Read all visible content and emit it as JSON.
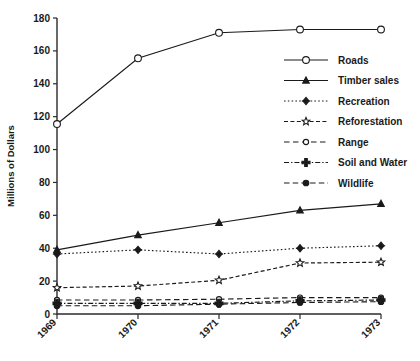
{
  "chart_data": {
    "type": "line",
    "title": "",
    "xlabel": "",
    "ylabel": "Millions of Dollars",
    "categories": [
      "1969",
      "1970",
      "1971",
      "1972",
      "1973"
    ],
    "x": [
      1969,
      1970,
      1971,
      1972,
      1973
    ],
    "xlim": [
      1969,
      1973
    ],
    "ylim": [
      0,
      180
    ],
    "yticks": [
      0,
      20,
      40,
      60,
      80,
      100,
      120,
      140,
      160,
      180
    ],
    "ytick_labels": [
      "0",
      "20",
      "40",
      "60",
      "80",
      "100",
      "120",
      "140",
      "160",
      "180"
    ],
    "grid": false,
    "legend_position": "right-upper",
    "series": [
      {
        "name": "Roads",
        "marker": "circle-open",
        "linestyle": "solid",
        "values": [
          115.5,
          155.5,
          171,
          173,
          173
        ]
      },
      {
        "name": "Timber sales",
        "marker": "triangle-solid",
        "linestyle": "solid",
        "values": [
          39,
          48,
          55.5,
          63,
          67
        ]
      },
      {
        "name": "Recreation",
        "marker": "diamond-solid",
        "linestyle": "dotted",
        "values": [
          36.5,
          39,
          36.5,
          40,
          41.5
        ]
      },
      {
        "name": "Reforestation",
        "marker": "star-open",
        "linestyle": "dashed",
        "values": [
          16,
          17,
          20.5,
          31,
          31.5
        ]
      },
      {
        "name": "Range",
        "marker": "circle-open-small",
        "linestyle": "dashed-long",
        "values": [
          8.5,
          8.5,
          9,
          10,
          10
        ]
      },
      {
        "name": "Soil and Water",
        "marker": "plus-solid",
        "linestyle": "dashdot",
        "values": [
          6.5,
          6.5,
          6.5,
          8,
          8.5
        ]
      },
      {
        "name": "Wildlife",
        "marker": "circle-solid",
        "linestyle": "dashed-long2",
        "values": [
          5,
          5,
          6,
          7,
          7.5
        ]
      }
    ]
  },
  "legend": {
    "entries": [
      {
        "label": "Roads"
      },
      {
        "label": "Timber sales"
      },
      {
        "label": "Recreation"
      },
      {
        "label": "Reforestation"
      },
      {
        "label": "Range"
      },
      {
        "label": "Soil and Water"
      },
      {
        "label": "Wildlife"
      }
    ]
  },
  "colors": {
    "ink": "#1a1a1a",
    "axis": "#2b2b2b",
    "background": "#ffffff"
  }
}
